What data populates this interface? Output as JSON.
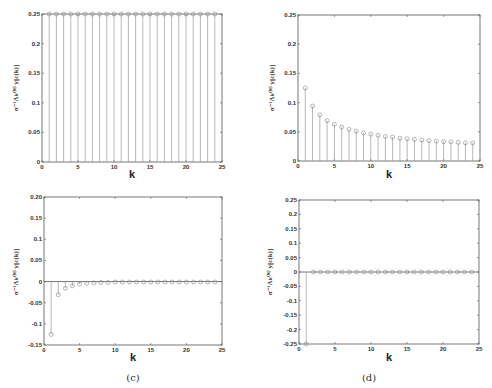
{
  "chart_data": [
    {
      "id": "a",
      "type": "stem",
      "caption": "",
      "xlabel": "k",
      "ylabel": "σ⁻¹Λₖ⁽ᴺ⁾ y[c(k)]",
      "xlim": [
        0,
        25
      ],
      "ylim": [
        0,
        0.25
      ],
      "xticks": [
        0,
        5,
        10,
        15,
        20,
        25
      ],
      "xtick_labels": [
        "0",
        "5",
        "10",
        "15",
        "20",
        "25"
      ],
      "yticks": [
        0,
        0.05,
        0.1,
        0.15,
        0.2,
        0.25
      ],
      "ytick_labels": [
        "0",
        "0.05",
        "0.1",
        "0.15",
        "0.2",
        "0.25"
      ],
      "x": [
        1,
        2,
        3,
        4,
        5,
        6,
        7,
        8,
        9,
        10,
        11,
        12,
        13,
        14,
        15,
        16,
        17,
        18,
        19,
        20,
        21,
        22,
        23,
        24
      ],
      "y": [
        0.25,
        0.25,
        0.25,
        0.25,
        0.25,
        0.25,
        0.25,
        0.25,
        0.25,
        0.25,
        0.25,
        0.25,
        0.25,
        0.25,
        0.25,
        0.25,
        0.25,
        0.25,
        0.25,
        0.25,
        0.25,
        0.25,
        0.25,
        0.25
      ],
      "grid": false
    },
    {
      "id": "b",
      "type": "stem",
      "caption": "",
      "xlabel": "k",
      "ylabel": "σ⁻¹Λₖ⁽ᴺ⁾ y[c(k)]",
      "xlim": [
        0,
        25
      ],
      "ylim": [
        0,
        0.25
      ],
      "xticks": [
        0,
        5,
        10,
        15,
        20,
        25
      ],
      "xtick_labels": [
        "0",
        "5",
        "10",
        "15",
        "20",
        "25"
      ],
      "yticks": [
        0,
        0.05,
        0.1,
        0.15,
        0.2,
        0.25
      ],
      "ytick_labels": [
        "0",
        "0.05",
        "0.1",
        "0.15",
        "0.2",
        "0.25"
      ],
      "x": [
        1,
        2,
        3,
        4,
        5,
        6,
        7,
        8,
        9,
        10,
        11,
        12,
        13,
        14,
        15,
        16,
        17,
        18,
        19,
        20,
        21,
        22,
        23,
        24
      ],
      "y": [
        0.125,
        0.094,
        0.079,
        0.069,
        0.063,
        0.058,
        0.054,
        0.051,
        0.048,
        0.046,
        0.044,
        0.042,
        0.041,
        0.039,
        0.038,
        0.037,
        0.036,
        0.035,
        0.034,
        0.033,
        0.033,
        0.032,
        0.031,
        0.031
      ],
      "grid": false
    },
    {
      "id": "c",
      "type": "stem",
      "caption": "(c)",
      "xlabel": "k",
      "ylabel": "σ⁻¹Λₖ⁽ᴺ⁾ y[c(k)]",
      "xlim": [
        0,
        25
      ],
      "ylim": [
        -0.15,
        0.2
      ],
      "xticks": [
        0,
        5,
        10,
        15,
        20,
        25
      ],
      "xtick_labels": [
        "0",
        "5",
        "10",
        "15",
        "20",
        "25"
      ],
      "yticks": [
        -0.15,
        -0.1,
        -0.05,
        0,
        0.05,
        0.1,
        0.15,
        0.2
      ],
      "ytick_labels": [
        "-0.15",
        "-0.1",
        "-0.05",
        "0",
        "0.05",
        "0.1",
        "0.15",
        "0.20"
      ],
      "x": [
        1,
        2,
        3,
        4,
        5,
        6,
        7,
        8,
        9,
        10,
        11,
        12,
        13,
        14,
        15,
        16,
        17,
        18,
        19,
        20,
        21,
        22,
        23,
        24
      ],
      "y": [
        -0.125,
        -0.031,
        -0.016,
        -0.01,
        -0.006,
        -0.004,
        -0.003,
        -0.002,
        -0.002,
        -0.001,
        -0.001,
        -0.001,
        -0.001,
        -0.001,
        -0.001,
        -0.001,
        -0.001,
        -0.001,
        -0.001,
        -0.001,
        -0.001,
        -0.001,
        -0.001,
        -0.001
      ],
      "grid": false
    },
    {
      "id": "d",
      "type": "stem",
      "caption": "(d)",
      "xlabel": "k",
      "ylabel": "σ⁻¹Λₖ⁽ᴺ⁾ y[c(k)]",
      "xlim": [
        0,
        25
      ],
      "ylim": [
        -0.25,
        0.25
      ],
      "xticks": [
        0,
        5,
        10,
        15,
        20,
        25
      ],
      "xtick_labels": [
        "0",
        "5",
        "10",
        "15",
        "20",
        "25"
      ],
      "yticks": [
        -0.25,
        -0.2,
        -0.15,
        -0.1,
        -0.05,
        0,
        0.05,
        0.1,
        0.15,
        0.2,
        0.25
      ],
      "ytick_labels": [
        "-0.25",
        "-0.2",
        "-0.15",
        "-0.1",
        "-0.05",
        "0",
        "0.05",
        "0.1",
        "0.15",
        "0.2",
        "0.25"
      ],
      "x": [
        1,
        2,
        3,
        4,
        5,
        6,
        7,
        8,
        9,
        10,
        11,
        12,
        13,
        14,
        15,
        16,
        17,
        18,
        19,
        20,
        21,
        22,
        23,
        24
      ],
      "y": [
        -0.25,
        0,
        0,
        0,
        0,
        0,
        0,
        0,
        0,
        0,
        0,
        0,
        0,
        0,
        0,
        0,
        0,
        0,
        0,
        0,
        0,
        0,
        0,
        0
      ],
      "grid": false
    }
  ]
}
